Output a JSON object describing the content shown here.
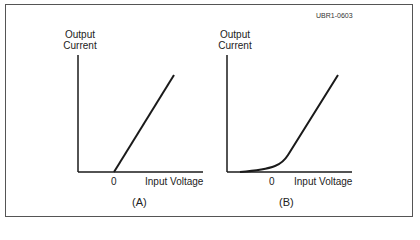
{
  "figure_id": "UBR1-0603",
  "panels": [
    {
      "caption": "(A)",
      "y_label_line1": "Output",
      "y_label_line2": "Current",
      "x_zero_label": "0",
      "x_label": "Input Voltage",
      "curve": "linear ramp starting at 0"
    },
    {
      "caption": "(B)",
      "y_label_line1": "Output",
      "y_label_line2": "Current",
      "x_zero_label": "0",
      "x_label": "Input Voltage",
      "curve": "soft knee: exponential tail below 0 then linear"
    }
  ],
  "colors": {
    "line": "#1a1a1a",
    "frame": "#555555"
  }
}
